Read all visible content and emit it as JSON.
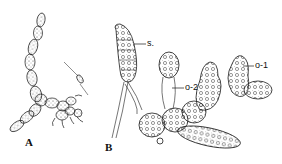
{
  "figure": {
    "panels": [
      {
        "id": "A",
        "label": "A"
      },
      {
        "id": "B",
        "label": "B"
      }
    ],
    "annotations": [
      {
        "id": "s",
        "label": "s."
      },
      {
        "id": "o2",
        "label": "o-2"
      },
      {
        "id": "o1",
        "label": "o-1"
      }
    ],
    "colors": {
      "ink": "#1a1a1a",
      "paper": "#ffffff"
    }
  }
}
